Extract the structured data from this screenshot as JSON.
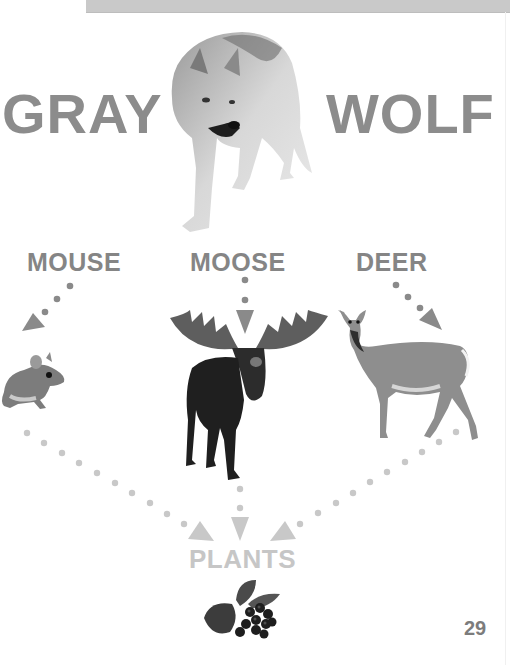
{
  "page": {
    "title": {
      "left": "GRAY",
      "right": "WOLF"
    },
    "predator": {
      "name": "Gray Wolf",
      "icon": "wolf-photo"
    },
    "prey": [
      {
        "label": "MOUSE",
        "icon": "mouse-photo"
      },
      {
        "label": "MOOSE",
        "icon": "moose-photo"
      },
      {
        "label": "DEER",
        "icon": "deer-photo"
      }
    ],
    "producer": {
      "label": "PLANTS",
      "icon": "berries-plant-photo"
    },
    "page_number": "29",
    "colors": {
      "title": "#8c8c8c",
      "prey_labels": "#858585",
      "upper_arrows": "#8a8a8a",
      "lower_arrows": "#c8c8c8",
      "plants_label": "#c6c6c6",
      "top_bar": "#c9c9c9"
    }
  }
}
